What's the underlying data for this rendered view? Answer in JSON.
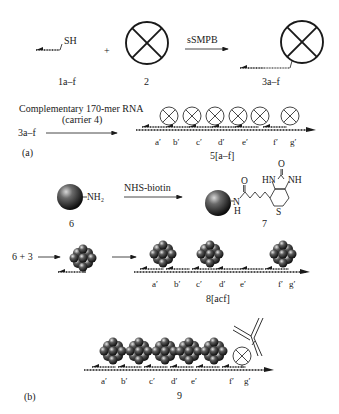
{
  "figure": {
    "panel_a": {
      "label": "(a)",
      "row1": {
        "reactant1_label": "1a–f",
        "reactant1_group": "SH",
        "plus": "+",
        "reactant2_label": "2",
        "reagent": "sSMPB",
        "product_label": "3a–f"
      },
      "row2": {
        "start_label": "3a–f",
        "reagent_line1": "Complementary 170-mer RNA",
        "reagent_line2": "(carrier 4)",
        "product_label": "5[a–f]",
        "positions": [
          "a′",
          "b′",
          "c′",
          "d′",
          "e′",
          "f′",
          "g′"
        ]
      }
    },
    "biotin_row": {
      "reactant_label": "6",
      "reactant_group": "NH₂",
      "reagent": "NHS-biotin",
      "product_label": "7",
      "product_atoms": {
        "carbonyl_O": "O",
        "amide_N": "N",
        "amide_H": "H",
        "urea_O": "O",
        "hn": "HN",
        "nh": "NH",
        "sulfur": "S"
      }
    },
    "assembly_row": {
      "start_label": "6 + 3",
      "product_label": "8[acf]",
      "positions": [
        "a′",
        "b′",
        "c′",
        "d′",
        "e′",
        "f′",
        "g′"
      ]
    },
    "panel_b": {
      "label": "(b)",
      "product_label": "9",
      "positions": [
        "a′",
        "b′",
        "c′",
        "d′",
        "e′",
        "f′",
        "g′"
      ]
    },
    "colors": {
      "ink": "#1a1a1a",
      "background": "#ffffff",
      "sphere_dark": "#111111",
      "sphere_light": "#bdbdbd"
    }
  }
}
